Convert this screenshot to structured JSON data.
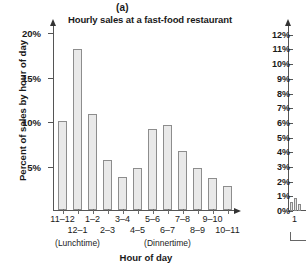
{
  "figure": {
    "panel_label": "(a)",
    "xtitle": "Hour of day"
  },
  "chart_data": {
    "type": "bar",
    "title": "Hourly sales at a fast-food restaurant",
    "xlabel": "Hour of day",
    "ylabel": "Percent of sales by hour of day",
    "ylim": [
      0,
      20.8
    ],
    "grid": false,
    "legend": null,
    "ytick_labels": [
      "20%",
      "15%",
      "10%",
      "5%"
    ],
    "ytick_values": [
      20,
      15,
      10,
      5
    ],
    "categories": [
      "11–12",
      "12–1",
      "1–2",
      "2–3",
      "3–4",
      "4–5",
      "5–6",
      "6–7",
      "7–8",
      "8–9",
      "9–10",
      "10–11"
    ],
    "values": [
      10.0,
      18.1,
      10.8,
      5.6,
      3.7,
      4.7,
      9.1,
      9.6,
      6.6,
      4.7,
      3.6,
      2.7
    ],
    "annotations": [
      {
        "text": "(Lunchtime)",
        "category": "12–1"
      },
      {
        "text": "(Dinnertime)",
        "category": "6–7"
      }
    ]
  },
  "right_partial_chart": {
    "ytick_labels": [
      "12%",
      "11%",
      "10%",
      "9%",
      "8%",
      "7%",
      "6%",
      "5%",
      "4%",
      "3%",
      "2%",
      "1%",
      "0%"
    ],
    "ytick_values": [
      12,
      11,
      10,
      9,
      8,
      7,
      6,
      5,
      4,
      3,
      2,
      1,
      0
    ],
    "xtick_label": "1",
    "bar_values": [
      0.6,
      0.9,
      0.5
    ]
  }
}
